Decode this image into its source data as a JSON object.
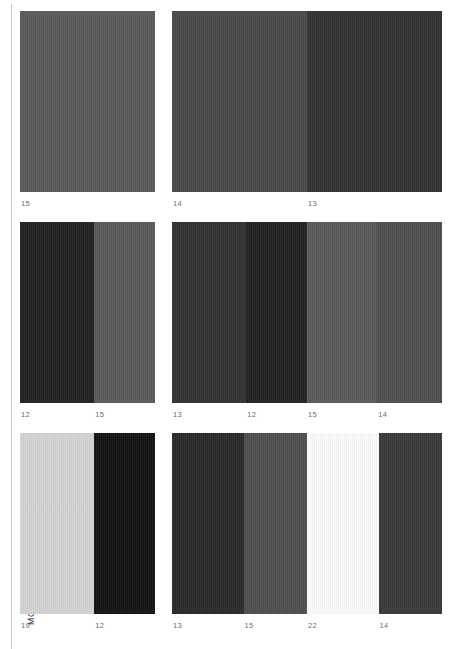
{
  "page": {
    "section_label": "MONOCHROMATIC",
    "background_color": "#ffffff",
    "rule_color": "#c9c9c9",
    "caption_color": "#6e6e6e"
  },
  "grid": {
    "columns": 3,
    "rows": 3,
    "plates": [
      {
        "id": "plate-r1c1",
        "bands": [
          {
            "label": "15",
            "color": "#5a5a5a",
            "width_pct": 100
          }
        ]
      },
      {
        "id": "plate-r1c2",
        "bands": [
          {
            "label": "14",
            "color": "#4a4a4a",
            "width_pct": 100
          }
        ]
      },
      {
        "id": "plate-r1c3",
        "bands": [
          {
            "label": "13",
            "color": "#333333",
            "width_pct": 100
          }
        ]
      },
      {
        "id": "plate-r2c1",
        "bands": [
          {
            "label": "12",
            "color": "#222222",
            "width_pct": 55
          },
          {
            "label": "15",
            "color": "#5a5a5a",
            "width_pct": 45
          }
        ]
      },
      {
        "id": "plate-r2c2",
        "bands": [
          {
            "label": "13",
            "color": "#333333",
            "width_pct": 55
          },
          {
            "label": "12",
            "color": "#222222",
            "width_pct": 45
          }
        ]
      },
      {
        "id": "plate-r2c3",
        "bands": [
          {
            "label": "15",
            "color": "#5a5a5a",
            "width_pct": 52
          },
          {
            "label": "14",
            "color": "#4f4f4f",
            "width_pct": 48
          }
        ]
      },
      {
        "id": "plate-r3c1",
        "bands": [
          {
            "label": "19",
            "color": "#d3d3d3",
            "width_pct": 55
          },
          {
            "label": "12",
            "color": "#141414",
            "width_pct": 45
          }
        ]
      },
      {
        "id": "plate-r3c2",
        "bands": [
          {
            "label": "13",
            "color": "#2b2b2b",
            "width_pct": 53
          },
          {
            "label": "15",
            "color": "#4f4f4f",
            "width_pct": 47
          }
        ]
      },
      {
        "id": "plate-r3c3",
        "bands": [
          {
            "label": "22",
            "color": "#fbfbfb",
            "width_pct": 53
          },
          {
            "label": "14",
            "color": "#3a3a3a",
            "width_pct": 47
          }
        ]
      }
    ]
  }
}
